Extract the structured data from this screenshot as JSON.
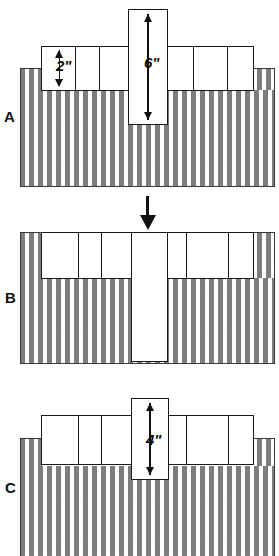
{
  "figure": {
    "background_color": "#ffffff",
    "ink_color": "#111111",
    "liquid_hatch_color": "#7d7d7d",
    "block_fill_color": "#ffffff"
  },
  "panels": [
    {
      "id": "A",
      "letter": "A",
      "description": "Plunger raised above liquid; side blocks resting on liquid surface",
      "dimensions": [
        {
          "name": "side-block-height",
          "label": "2\"",
          "value": 2,
          "unit": "inch",
          "orientation": "vertical"
        },
        {
          "name": "plunger-height",
          "label": "6\"",
          "value": 6,
          "unit": "inch",
          "orientation": "vertical"
        }
      ],
      "left_block_segments": 3,
      "right_block_segments": 3
    },
    {
      "id": "B",
      "letter": "B",
      "description": "Plunger pushed down fully into the liquid; side blocks displaced upward",
      "dimensions": [],
      "left_block_segments": 3,
      "right_block_segments": 3,
      "force_arrow": {
        "name": "downward-force-arrow",
        "direction": "down"
      }
    },
    {
      "id": "C",
      "letter": "C",
      "description": "Plunger partially submerged; equilibrium state",
      "dimensions": [
        {
          "name": "plunger-height",
          "label": "4\"",
          "value": 4,
          "unit": "inch",
          "orientation": "vertical"
        }
      ],
      "left_block_segments": 3,
      "right_block_segments": 3
    }
  ],
  "transition_arrows": [
    {
      "name": "arrow-a-to-b",
      "from": "A",
      "to": "B",
      "direction": "down"
    }
  ]
}
